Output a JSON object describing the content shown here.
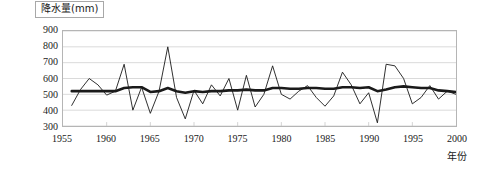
{
  "chart_data": {
    "type": "line",
    "title": "降水量(mm)",
    "xlabel": "年份",
    "ylabel": "降水量(mm)",
    "xlim": [
      1955,
      2000
    ],
    "ylim": [
      300,
      900
    ],
    "ytick_step": 100,
    "xtick_step": 5,
    "grid": true,
    "legend": "none",
    "yticks": [
      "900",
      "800",
      "700",
      "600",
      "500",
      "400",
      "300"
    ],
    "xticks": [
      "1955",
      "1960",
      "1965",
      "1970",
      "1975",
      "1980",
      "1985",
      "1990",
      "1995",
      "2000"
    ],
    "x": [
      1956,
      1957,
      1958,
      1959,
      1960,
      1961,
      1962,
      1963,
      1964,
      1965,
      1966,
      1967,
      1968,
      1969,
      1970,
      1971,
      1972,
      1973,
      1974,
      1975,
      1976,
      1977,
      1978,
      1979,
      1980,
      1981,
      1982,
      1983,
      1984,
      1985,
      1986,
      1987,
      1988,
      1989,
      1990,
      1991,
      1992,
      1993,
      1994,
      1995,
      1996,
      1997,
      1998,
      1999,
      2000
    ],
    "series": [
      {
        "name": "年降水量",
        "style": "thin",
        "color": "#1a1a1a",
        "values": [
          430,
          530,
          600,
          560,
          495,
          520,
          690,
          400,
          545,
          380,
          520,
          800,
          480,
          345,
          525,
          440,
          560,
          490,
          600,
          400,
          620,
          420,
          500,
          680,
          500,
          470,
          520,
          555,
          480,
          425,
          490,
          640,
          560,
          440,
          510,
          320,
          690,
          680,
          600,
          440,
          480,
          555,
          470,
          520,
          500
        ]
      },
      {
        "name": "趋势/滑动平均",
        "style": "thick",
        "color": "#1a1a1a",
        "values": [
          520,
          520,
          520,
          520,
          520,
          520,
          540,
          545,
          545,
          515,
          520,
          540,
          520,
          510,
          520,
          515,
          520,
          520,
          525,
          525,
          530,
          525,
          525,
          540,
          540,
          535,
          535,
          540,
          540,
          535,
          535,
          545,
          545,
          540,
          545,
          520,
          530,
          545,
          550,
          545,
          540,
          540,
          525,
          520,
          515
        ]
      }
    ]
  }
}
